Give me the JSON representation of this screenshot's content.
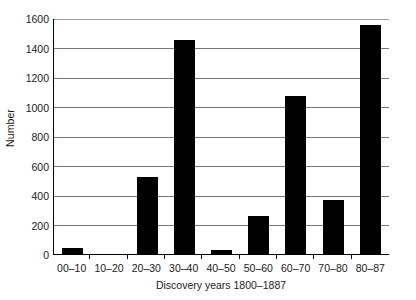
{
  "chart_data": {
    "type": "bar",
    "title": "",
    "xlabel": "Discovery years 1800–1887",
    "ylabel": "Number",
    "categories": [
      "00–10",
      "10–20",
      "20–30",
      "30–40",
      "40–50",
      "50–60",
      "60–70",
      "70–80",
      "80–87"
    ],
    "values": [
      40,
      0,
      525,
      1450,
      30,
      255,
      1070,
      365,
      1550
    ],
    "ylim": [
      0,
      1600
    ],
    "ytick_labels": [
      "0",
      "200",
      "400",
      "600",
      "800",
      "1000",
      "1200",
      "1400",
      "1600"
    ],
    "ytick_values": [
      0,
      200,
      400,
      600,
      800,
      1000,
      1200,
      1400,
      1600
    ],
    "grid": "horizontal",
    "legend": "none",
    "bar_color": "#000000",
    "grid_color": "#777777",
    "axis_color": "#000000",
    "background_color": "#ffffff"
  }
}
